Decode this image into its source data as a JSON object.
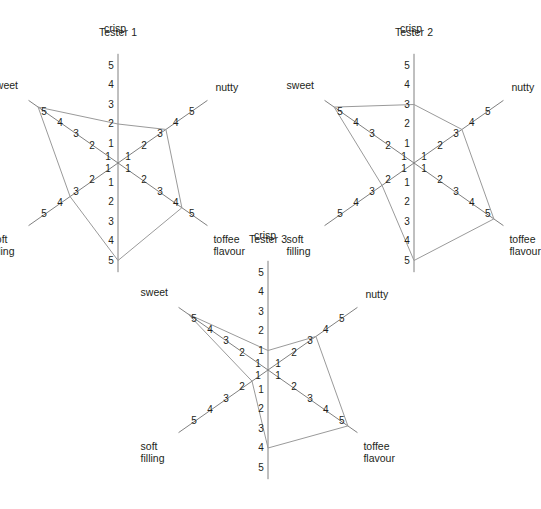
{
  "figure": {
    "background": "#ffffff",
    "axis_color": "#808080",
    "data_color": "#9a9a9a",
    "text_color": "#231f20",
    "scale_min": 1,
    "scale_max": 5,
    "tick_labels": [
      "1",
      "2",
      "3",
      "4",
      "5"
    ]
  },
  "axes": {
    "crisp": "crisp",
    "nutty": "nutty",
    "toffee": "toffee\nflavour",
    "toffee_line1": "toffee",
    "toffee_line2": "flavour",
    "soft": "soft\nfilling",
    "soft_line1": "soft",
    "soft_line2": "filling",
    "sweet": "sweet"
  },
  "chart_data": {
    "type": "radar",
    "axis_count": 6,
    "axis_order": [
      "crisp",
      "nutty",
      "toffee flavour",
      "bottom",
      "soft filling",
      "sweet"
    ],
    "axis_labels": [
      "crisp",
      "nutty",
      "toffee flavour",
      "",
      "soft filling",
      "sweet"
    ],
    "axis_angles_deg": [
      90,
      35,
      -35,
      -90,
      -145,
      145
    ],
    "rlim": [
      0,
      5
    ],
    "rticks": [
      1,
      2,
      3,
      4,
      5
    ],
    "grid": false,
    "legend": "none",
    "charts": [
      {
        "title": "Tester 1",
        "values": {
          "crisp": 2,
          "nutty": 3,
          "toffee flavour": 4,
          "bottom": 5,
          "soft filling": 3,
          "sweet": 5
        },
        "series": [
          2,
          3,
          4,
          5,
          3,
          5
        ]
      },
      {
        "title": "Tester 2",
        "values": {
          "crisp": 3,
          "nutty": 3,
          "toffee flavour": 5,
          "bottom": 5,
          "soft filling": 2,
          "sweet": 5
        },
        "series": [
          3,
          3,
          5,
          5,
          2,
          5
        ]
      },
      {
        "title": "Tester 3",
        "values": {
          "crisp": 1,
          "nutty": 3,
          "toffee flavour": 5,
          "bottom": 4,
          "soft filling": 1,
          "sweet": 5
        },
        "series": [
          1,
          3,
          5,
          4,
          1,
          5
        ]
      }
    ]
  }
}
